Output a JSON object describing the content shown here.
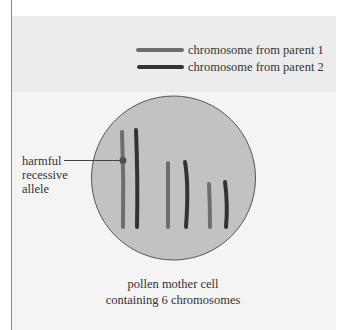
{
  "legend": {
    "items": [
      {
        "label": "chromosome from parent 1",
        "color": "#6e6e6e"
      },
      {
        "label": "chromosome from parent 2",
        "color": "#333333"
      }
    ]
  },
  "cell": {
    "fill": "#c2c2c2",
    "stroke": "#555555",
    "caption_line1": "pollen mother cell",
    "caption_line2": "containing 6 chromosomes",
    "chromosome_count": 6
  },
  "annotation": {
    "line1": "harmful",
    "line2": "recessive",
    "line3": "allele"
  },
  "chromosomes": [
    {
      "parent": 1,
      "x": 123,
      "y1": 132,
      "y2": 227
    },
    {
      "parent": 2,
      "x": 137,
      "y1": 130,
      "y2": 227
    },
    {
      "parent": 1,
      "x": 168,
      "y1": 162,
      "y2": 227
    },
    {
      "parent": 2,
      "x": 186,
      "y1": 162,
      "y2": 227
    },
    {
      "parent": 1,
      "x": 209,
      "y1": 183,
      "y2": 227
    },
    {
      "parent": 2,
      "x": 226,
      "y1": 181,
      "y2": 227
    }
  ]
}
